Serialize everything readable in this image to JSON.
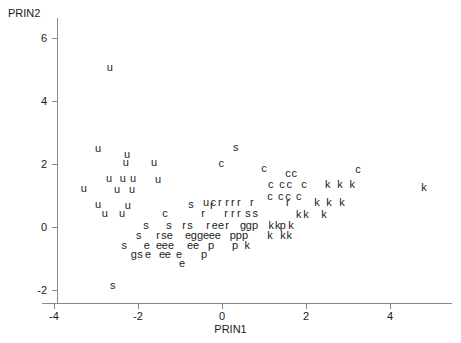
{
  "chart_data": {
    "type": "scatter",
    "title": "",
    "xlabel": "PRIN1",
    "ylabel": "PRIN2",
    "xlim": [
      -4.45,
      5.45
    ],
    "ylim": [
      -2.45,
      6.9
    ],
    "xticks": [
      -4,
      -2,
      0,
      2,
      4
    ],
    "xticklabels": [
      "-4",
      "-2",
      "0",
      "2",
      "4"
    ],
    "yticks": [
      6,
      4,
      2,
      0,
      -2
    ],
    "yticklabels": [
      "6",
      "4",
      "2",
      "0",
      "-2"
    ],
    "grid": false,
    "legend": null,
    "marker_style": "text-label",
    "group_labels": [
      "u",
      "c",
      "s",
      "r",
      "e",
      "g",
      "p",
      "k"
    ],
    "points": [
      {
        "label": "u",
        "x": -2.67,
        "y": 5.09
      },
      {
        "label": "u",
        "x": -2.95,
        "y": 2.52
      },
      {
        "label": "u",
        "x": -2.26,
        "y": 2.33
      },
      {
        "label": "s",
        "x": 0.33,
        "y": 2.55
      },
      {
        "label": "u",
        "x": -2.29,
        "y": 2.05
      },
      {
        "label": "u",
        "x": -1.62,
        "y": 2.07
      },
      {
        "label": "c",
        "x": -0.02,
        "y": 2.02
      },
      {
        "label": "c",
        "x": 1.0,
        "y": 1.88
      },
      {
        "label": "c",
        "x": 1.57,
        "y": 1.72
      },
      {
        "label": "c",
        "x": 1.72,
        "y": 1.72
      },
      {
        "label": "c",
        "x": 3.24,
        "y": 1.83
      },
      {
        "label": "u",
        "x": -2.69,
        "y": 1.55
      },
      {
        "label": "u",
        "x": -2.36,
        "y": 1.55
      },
      {
        "label": "u",
        "x": -2.12,
        "y": 1.55
      },
      {
        "label": "u",
        "x": -1.52,
        "y": 1.52
      },
      {
        "label": "c",
        "x": 1.16,
        "y": 1.38
      },
      {
        "label": "c",
        "x": 1.43,
        "y": 1.38
      },
      {
        "label": "c",
        "x": 1.6,
        "y": 1.38
      },
      {
        "label": "c",
        "x": 1.95,
        "y": 1.38
      },
      {
        "label": "k",
        "x": 2.52,
        "y": 1.36
      },
      {
        "label": "k",
        "x": 2.81,
        "y": 1.36
      },
      {
        "label": "k",
        "x": 3.1,
        "y": 1.36
      },
      {
        "label": "k",
        "x": 4.81,
        "y": 1.28
      },
      {
        "label": "u",
        "x": -3.29,
        "y": 1.24
      },
      {
        "label": "u",
        "x": -2.5,
        "y": 1.22
      },
      {
        "label": "u",
        "x": -2.14,
        "y": 1.22
      },
      {
        "label": "c",
        "x": 1.14,
        "y": 1.0
      },
      {
        "label": "c",
        "x": 1.4,
        "y": 1.0
      },
      {
        "label": "c",
        "x": 1.57,
        "y": 1.0
      },
      {
        "label": "c",
        "x": 1.83,
        "y": 1.0
      },
      {
        "label": "u",
        "x": -0.38,
        "y": 0.8
      },
      {
        "label": "c",
        "x": -0.21,
        "y": 0.8
      },
      {
        "label": "r",
        "x": -0.05,
        "y": 0.8
      },
      {
        "label": "r",
        "x": 0.12,
        "y": 0.8
      },
      {
        "label": "r",
        "x": 0.26,
        "y": 0.8
      },
      {
        "label": "r",
        "x": 0.4,
        "y": 0.8
      },
      {
        "label": "r",
        "x": 0.71,
        "y": 0.8
      },
      {
        "label": "k",
        "x": 2.26,
        "y": 0.78
      },
      {
        "label": "k",
        "x": 2.55,
        "y": 0.78
      },
      {
        "label": "k",
        "x": 2.86,
        "y": 0.78
      },
      {
        "label": "r",
        "x": 1.57,
        "y": 0.78
      },
      {
        "label": "u",
        "x": -2.95,
        "y": 0.73
      },
      {
        "label": "u",
        "x": -2.24,
        "y": 0.71
      },
      {
        "label": "s",
        "x": -0.74,
        "y": 0.74
      },
      {
        "label": "r",
        "x": -0.24,
        "y": 0.71
      },
      {
        "label": "u",
        "x": -2.79,
        "y": 0.43
      },
      {
        "label": "u",
        "x": -2.38,
        "y": 0.43
      },
      {
        "label": "c",
        "x": -1.36,
        "y": 0.43
      },
      {
        "label": "r",
        "x": -0.45,
        "y": 0.43
      },
      {
        "label": "r",
        "x": 0.1,
        "y": 0.43
      },
      {
        "label": "r",
        "x": 0.26,
        "y": 0.43
      },
      {
        "label": "r",
        "x": 0.4,
        "y": 0.43
      },
      {
        "label": "s",
        "x": 0.62,
        "y": 0.43
      },
      {
        "label": "s",
        "x": 0.79,
        "y": 0.43
      },
      {
        "label": "k",
        "x": 1.83,
        "y": 0.41
      },
      {
        "label": "k",
        "x": 2.0,
        "y": 0.41
      },
      {
        "label": "k",
        "x": 2.43,
        "y": 0.41
      },
      {
        "label": "s",
        "x": -1.81,
        "y": 0.07
      },
      {
        "label": "s",
        "x": -1.26,
        "y": 0.07
      },
      {
        "label": "r",
        "x": -0.9,
        "y": 0.07
      },
      {
        "label": "s",
        "x": -0.76,
        "y": 0.07
      },
      {
        "label": "r",
        "x": -0.33,
        "y": 0.07
      },
      {
        "label": "e",
        "x": -0.17,
        "y": 0.07
      },
      {
        "label": "e",
        "x": -0.02,
        "y": 0.07
      },
      {
        "label": "r",
        "x": 0.12,
        "y": 0.07
      },
      {
        "label": "g",
        "x": 0.5,
        "y": 0.07
      },
      {
        "label": "g",
        "x": 0.64,
        "y": 0.07
      },
      {
        "label": "p",
        "x": 0.79,
        "y": 0.07
      },
      {
        "label": "k",
        "x": 1.17,
        "y": 0.07
      },
      {
        "label": "k",
        "x": 1.33,
        "y": 0.07
      },
      {
        "label": "p",
        "x": 1.45,
        "y": 0.07
      },
      {
        "label": "k",
        "x": 1.64,
        "y": 0.07
      },
      {
        "label": "s",
        "x": -1.98,
        "y": -0.26
      },
      {
        "label": "r",
        "x": -1.52,
        "y": -0.26
      },
      {
        "label": "s",
        "x": -1.38,
        "y": -0.26
      },
      {
        "label": "e",
        "x": -1.24,
        "y": -0.26
      },
      {
        "label": "e",
        "x": -0.81,
        "y": -0.26
      },
      {
        "label": "g",
        "x": -0.67,
        "y": -0.26
      },
      {
        "label": "g",
        "x": -0.52,
        "y": -0.26
      },
      {
        "label": "e",
        "x": -0.38,
        "y": -0.26
      },
      {
        "label": "e",
        "x": -0.24,
        "y": -0.26
      },
      {
        "label": "e",
        "x": -0.1,
        "y": -0.26
      },
      {
        "label": "p",
        "x": 0.26,
        "y": -0.26
      },
      {
        "label": "p",
        "x": 0.4,
        "y": -0.26
      },
      {
        "label": "p",
        "x": 0.55,
        "y": -0.26
      },
      {
        "label": "k",
        "x": 1.14,
        "y": -0.26
      },
      {
        "label": "k",
        "x": 1.45,
        "y": -0.26
      },
      {
        "label": "k",
        "x": 1.6,
        "y": -0.26
      },
      {
        "label": "s",
        "x": -2.33,
        "y": -0.57
      },
      {
        "label": "e",
        "x": -1.79,
        "y": -0.57
      },
      {
        "label": "e",
        "x": -1.5,
        "y": -0.57
      },
      {
        "label": "e",
        "x": -1.36,
        "y": -0.57
      },
      {
        "label": "e",
        "x": -1.21,
        "y": -0.57
      },
      {
        "label": "e",
        "x": -0.76,
        "y": -0.57
      },
      {
        "label": "e",
        "x": -0.62,
        "y": -0.57
      },
      {
        "label": "p",
        "x": -0.26,
        "y": -0.57
      },
      {
        "label": "p",
        "x": 0.31,
        "y": -0.57
      },
      {
        "label": "k",
        "x": 0.6,
        "y": -0.57
      },
      {
        "label": "g",
        "x": -2.1,
        "y": -0.86
      },
      {
        "label": "s",
        "x": -1.95,
        "y": -0.86
      },
      {
        "label": "e",
        "x": -1.76,
        "y": -0.86
      },
      {
        "label": "e",
        "x": -1.43,
        "y": -0.86
      },
      {
        "label": "e",
        "x": -1.29,
        "y": -0.86
      },
      {
        "label": "e",
        "x": -1.02,
        "y": -0.86
      },
      {
        "label": "p",
        "x": -0.43,
        "y": -0.86
      },
      {
        "label": "e",
        "x": -0.95,
        "y": -1.14
      },
      {
        "label": "s",
        "x": -2.6,
        "y": -1.83
      }
    ]
  },
  "axes": {
    "y_title": "PRIN2",
    "x_title": "PRIN1"
  },
  "colors": {
    "axis": "#8a8a8a",
    "text": "#1a1a1a",
    "marker": "#222222",
    "background": "#ffffff"
  }
}
